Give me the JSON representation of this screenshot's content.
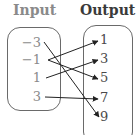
{
  "headers": {
    "input": "Input",
    "output": "Output"
  },
  "inputs": [
    {
      "label": "−3",
      "x": 19,
      "y": 36
    },
    {
      "label": "−1",
      "x": 19,
      "y": 53
    },
    {
      "label": "1",
      "x": 19,
      "y": 71
    },
    {
      "label": "3",
      "x": 19,
      "y": 90
    }
  ],
  "outputs": [
    {
      "label": "1",
      "x": 100,
      "y": 33
    },
    {
      "label": "3",
      "x": 100,
      "y": 52
    },
    {
      "label": "5",
      "x": 100,
      "y": 71
    },
    {
      "label": "7",
      "x": 100,
      "y": 91
    },
    {
      "label": "9",
      "x": 100,
      "y": 110
    }
  ],
  "mappings": [
    {
      "from": "−3",
      "to": "9",
      "x1": 44,
      "y1": 42,
      "x2": 99,
      "y2": 117
    },
    {
      "from": "−1",
      "to": "1",
      "x1": 48,
      "y1": 60,
      "x2": 98,
      "y2": 41
    },
    {
      "from": "−1",
      "to": "5",
      "x1": 48,
      "y1": 60,
      "x2": 98,
      "y2": 79
    },
    {
      "from": "1",
      "to": "3",
      "x1": 46,
      "y1": 78,
      "x2": 98,
      "y2": 60
    },
    {
      "from": "3",
      "to": "7",
      "x1": 45,
      "y1": 97,
      "x2": 98,
      "y2": 99
    }
  ],
  "colors": {
    "input_text": "#8a8a8a",
    "output_text": "#4a4a4a",
    "arrow": "#222222",
    "box_border": "#6a6a6a"
  }
}
